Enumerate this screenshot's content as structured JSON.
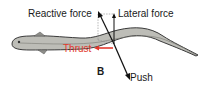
{
  "diagram": {
    "panel_letter": "B",
    "labels": {
      "reactive_force": "Reactive force",
      "lateral_force": "Lateral force",
      "thrust": "Thrust",
      "push": "Push"
    },
    "colors": {
      "body_fill": "#bdbdb7",
      "body_outline": "#3a3a3a",
      "thrust": "#e23a2e",
      "vector": "#111111",
      "guide_dashed": "#888888",
      "text": "#1a1a1a"
    }
  }
}
